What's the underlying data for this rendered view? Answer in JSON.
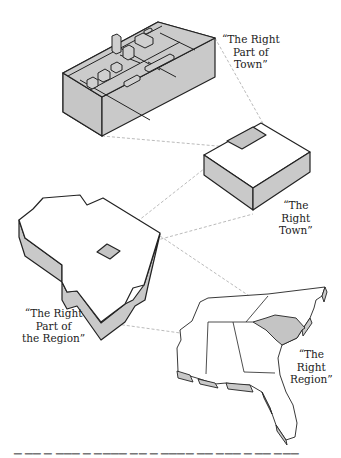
{
  "diagram": {
    "type": "hierarchical-zoom-illustration",
    "colors": {
      "outline": "#222222",
      "side_fill": "#c9c9c9",
      "highlight_fill": "#c4c4c4",
      "top_fill": "#ffffff",
      "connector": "#bbbbbb",
      "background": "#ffffff"
    },
    "levels": [
      {
        "id": "part-of-town",
        "graphic": "isometric-city-block-with-buildings",
        "label_lines": [
          "“The Right",
          "Part of",
          "Town”"
        ]
      },
      {
        "id": "town",
        "graphic": "isometric-box-with-highlighted-corner",
        "label_lines": [
          "“The",
          "Right",
          "Town”"
        ]
      },
      {
        "id": "part-of-region",
        "graphic": "extruded-state-shape-with-highlighted-square",
        "label_lines": [
          "“The Right",
          "Part of",
          "the Region”"
        ]
      },
      {
        "id": "region",
        "graphic": "extruded-southeastern-us-map-with-highlighted-state",
        "label_lines": [
          "“The",
          "Right",
          "Region”"
        ]
      }
    ],
    "connectors": [
      {
        "from": "town.highlight",
        "to": "part-of-town.block"
      },
      {
        "from": "part-of-region.highlight",
        "to": "town.box"
      },
      {
        "from": "region.highlight-state",
        "to": "part-of-region.shape"
      }
    ],
    "caption_clipped": "(caption cut off at bottom edge)"
  }
}
